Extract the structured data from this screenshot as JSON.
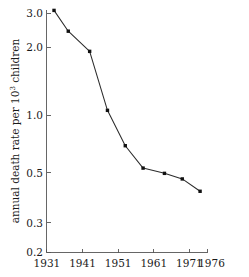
{
  "chart_data": {
    "type": "line",
    "title": "",
    "subtitle": "",
    "xlabel": "",
    "ylabel": "annual death rate per 10³ children",
    "ylabel_base": "annual death rate per 10",
    "ylabel_exponent": "3",
    "ylabel_tail": " children",
    "yscale": "log",
    "xscale": "linear",
    "grid": false,
    "legend": "none",
    "xlim": [
      1931,
      1976
    ],
    "ylim": [
      0.2,
      3.2
    ],
    "xticks": [
      1931,
      1941,
      1951,
      1961,
      1971,
      1976
    ],
    "xticklabels": [
      "1931",
      "1941",
      "1951",
      "1961",
      "1971",
      "1976"
    ],
    "yticks": [
      0.2,
      0.3,
      0.5,
      1.0,
      2.0,
      3.0
    ],
    "yticklabels": [
      "0.2",
      "0.3",
      "0.5",
      "1.0",
      "2.0",
      "3.0"
    ],
    "x": [
      1933,
      1937,
      1943,
      1948,
      1953,
      1958,
      1964,
      1969,
      1974
    ],
    "values": [
      3.1,
      2.45,
      1.95,
      1.0,
      0.67,
      0.52,
      0.49,
      0.46,
      0.4
    ],
    "series": [
      {
        "name": "annual death rate",
        "x": [
          1933,
          1937,
          1943,
          1948,
          1953,
          1958,
          1964,
          1969,
          1974
        ],
        "values": [
          3.1,
          2.45,
          1.95,
          1.0,
          0.67,
          0.52,
          0.49,
          0.46,
          0.4
        ],
        "color": "#2b2b2b",
        "marker": "square"
      }
    ],
    "annotations": []
  },
  "colors": {
    "line": "#2b2b2b",
    "marker": "#111111",
    "axis": "#555555",
    "text": "#1a1a1a",
    "background": "#ffffff"
  }
}
